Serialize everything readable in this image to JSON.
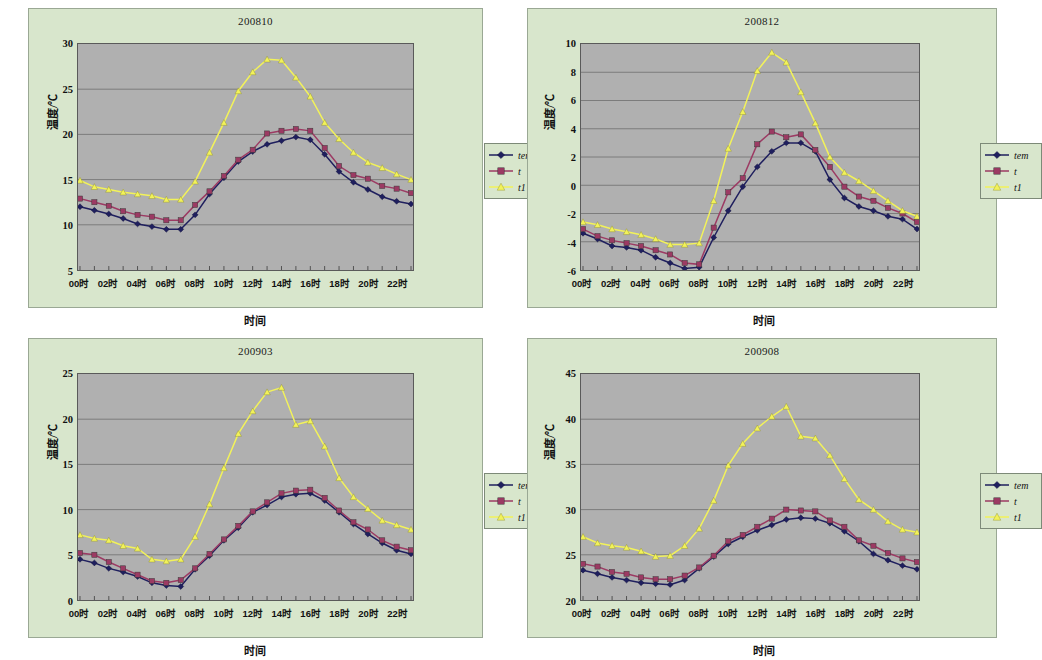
{
  "figure": {
    "background": "#ffffff",
    "chart_bg": "#d8e6cc",
    "plot_bg": "#b0b0b0",
    "series_colors": {
      "tem": "#1f1f5e",
      "t": "#9c3a63",
      "t1": "#f2f25a"
    }
  },
  "common": {
    "ylabel": "温度/℃",
    "xlabel": "时间",
    "xtick_labels": [
      "00时",
      "02时",
      "04时",
      "06时",
      "08时",
      "10时",
      "12时",
      "14时",
      "16时",
      "18时",
      "20时",
      "22时"
    ],
    "legend": [
      {
        "name": "tem",
        "label": "tem",
        "marker": "diamond",
        "color": "#1f1f5e"
      },
      {
        "name": "t",
        "label": "t",
        "marker": "square",
        "color": "#9c3a63"
      },
      {
        "name": "t1",
        "label": "t1",
        "marker": "triangle",
        "color": "#f2f25a"
      }
    ]
  },
  "chart_data": [
    {
      "id": "chart-200810",
      "type": "line",
      "title": "200810",
      "xlabel": "时间",
      "ylabel": "温度/℃",
      "ylim": [
        5,
        30
      ],
      "yticks": [
        5,
        10,
        15,
        20,
        25,
        30
      ],
      "grid": true,
      "legend_position": "right",
      "x": [
        "00时",
        "01时",
        "02时",
        "03时",
        "04时",
        "05时",
        "06时",
        "07时",
        "08时",
        "09时",
        "10时",
        "11时",
        "12时",
        "13时",
        "14时",
        "15时",
        "16时",
        "17时",
        "18时",
        "19时",
        "20时",
        "21时",
        "22时",
        "23时"
      ],
      "categories": [
        "00时",
        "02时",
        "04时",
        "06时",
        "08时",
        "10时",
        "12时",
        "14时",
        "16时",
        "18时",
        "20时",
        "22时"
      ],
      "series": [
        {
          "name": "tem",
          "values": [
            12.0,
            11.6,
            11.2,
            10.7,
            10.1,
            9.8,
            9.5,
            9.5,
            11.1,
            13.4,
            15.2,
            17.0,
            18.1,
            18.9,
            19.3,
            19.7,
            19.4,
            17.8,
            15.9,
            14.7,
            13.9,
            13.1,
            12.6,
            12.3
          ]
        },
        {
          "name": "t",
          "values": [
            12.9,
            12.5,
            12.1,
            11.5,
            11.1,
            10.9,
            10.5,
            10.5,
            12.2,
            13.7,
            15.4,
            17.2,
            18.3,
            20.1,
            20.4,
            20.6,
            20.4,
            18.5,
            16.5,
            15.5,
            15.1,
            14.3,
            14.0,
            13.5
          ]
        },
        {
          "name": "t1",
          "values": [
            14.9,
            14.2,
            13.9,
            13.6,
            13.4,
            13.2,
            12.8,
            12.8,
            14.8,
            18.0,
            21.3,
            24.8,
            26.9,
            28.3,
            28.2,
            26.3,
            24.2,
            21.3,
            19.5,
            18.0,
            16.9,
            16.3,
            15.6,
            15.0
          ]
        }
      ]
    },
    {
      "id": "chart-200812",
      "type": "line",
      "title": "200812",
      "xlabel": "时间",
      "ylabel": "温度/℃",
      "ylim": [
        -6,
        10
      ],
      "yticks": [
        -6,
        -4,
        -2,
        0,
        2,
        4,
        6,
        8,
        10
      ],
      "grid": true,
      "legend_position": "right",
      "x": [
        "00时",
        "01时",
        "02时",
        "03时",
        "04时",
        "05时",
        "06时",
        "07时",
        "08时",
        "09时",
        "10时",
        "11时",
        "12时",
        "13时",
        "14时",
        "15时",
        "16时",
        "17时",
        "18时",
        "19时",
        "20时",
        "21时",
        "22时",
        "23时"
      ],
      "categories": [
        "00时",
        "02时",
        "04时",
        "06时",
        "08时",
        "10时",
        "12时",
        "14时",
        "16时",
        "18时",
        "20时",
        "22时"
      ],
      "series": [
        {
          "name": "tem",
          "values": [
            -3.4,
            -3.8,
            -4.3,
            -4.4,
            -4.6,
            -5.1,
            -5.5,
            -5.9,
            -5.8,
            -3.7,
            -1.8,
            -0.1,
            1.3,
            2.4,
            3.0,
            3.0,
            2.4,
            0.4,
            -0.9,
            -1.5,
            -1.8,
            -2.2,
            -2.4,
            -3.1
          ]
        },
        {
          "name": "t",
          "values": [
            -3.1,
            -3.6,
            -3.9,
            -4.1,
            -4.3,
            -4.6,
            -4.9,
            -5.5,
            -5.6,
            -3.0,
            -0.5,
            0.5,
            2.9,
            3.8,
            3.4,
            3.6,
            2.5,
            1.3,
            -0.1,
            -0.8,
            -1.1,
            -1.6,
            -2.0,
            -2.6
          ]
        },
        {
          "name": "t1",
          "values": [
            -2.6,
            -2.8,
            -3.1,
            -3.3,
            -3.5,
            -3.8,
            -4.2,
            -4.2,
            -4.1,
            -1.1,
            2.6,
            5.2,
            8.1,
            9.4,
            8.7,
            6.6,
            4.4,
            2.0,
            0.9,
            0.3,
            -0.4,
            -1.1,
            -1.8,
            -2.2
          ]
        }
      ]
    },
    {
      "id": "chart-200903",
      "type": "line",
      "title": "200903",
      "xlabel": "时间",
      "ylabel": "温度/℃",
      "ylim": [
        0,
        25
      ],
      "yticks": [
        0,
        5,
        10,
        15,
        20,
        25
      ],
      "grid": true,
      "legend_position": "right",
      "x": [
        "00时",
        "01时",
        "02时",
        "03时",
        "04时",
        "05时",
        "06时",
        "07时",
        "08时",
        "09时",
        "10时",
        "11时",
        "12时",
        "13时",
        "14时",
        "15时",
        "16时",
        "17时",
        "18时",
        "19时",
        "20时",
        "21时",
        "22时",
        "23时"
      ],
      "categories": [
        "00时",
        "02时",
        "04时",
        "06时",
        "08时",
        "10时",
        "12时",
        "14时",
        "16时",
        "18时",
        "20时",
        "22时"
      ],
      "series": [
        {
          "name": "tem",
          "values": [
            4.5,
            4.1,
            3.5,
            3.1,
            2.6,
            1.9,
            1.6,
            1.5,
            3.4,
            4.9,
            6.6,
            8.0,
            9.7,
            10.5,
            11.4,
            11.7,
            11.8,
            11.0,
            9.7,
            8.4,
            7.3,
            6.3,
            5.5,
            5.1
          ]
        },
        {
          "name": "t",
          "values": [
            5.2,
            5.0,
            4.2,
            3.5,
            2.8,
            2.1,
            1.9,
            2.2,
            3.5,
            5.1,
            6.7,
            8.2,
            9.8,
            10.8,
            11.8,
            12.1,
            12.2,
            11.3,
            9.9,
            8.6,
            7.8,
            6.6,
            5.9,
            5.5
          ]
        },
        {
          "name": "t1",
          "values": [
            7.2,
            6.8,
            6.6,
            6.0,
            5.7,
            4.5,
            4.3,
            4.5,
            7.0,
            10.6,
            14.6,
            18.4,
            20.9,
            23.0,
            23.5,
            19.4,
            19.8,
            17.0,
            13.5,
            11.4,
            10.1,
            8.8,
            8.3,
            7.8
          ]
        }
      ]
    },
    {
      "id": "chart-200908",
      "type": "line",
      "title": "200908",
      "xlabel": "时间",
      "ylabel": "温度/℃",
      "ylim": [
        20,
        45
      ],
      "yticks": [
        20,
        25,
        30,
        35,
        40,
        45
      ],
      "grid": true,
      "legend_position": "right",
      "x": [
        "00时",
        "01时",
        "02时",
        "03时",
        "04时",
        "05时",
        "06时",
        "07时",
        "08时",
        "09时",
        "10时",
        "11时",
        "12时",
        "13时",
        "14时",
        "15时",
        "16时",
        "17时",
        "18时",
        "19时",
        "20时",
        "21时",
        "22时",
        "23时"
      ],
      "categories": [
        "00时",
        "02时",
        "04时",
        "06时",
        "08时",
        "10时",
        "12时",
        "14时",
        "16时",
        "18时",
        "20时",
        "22时"
      ],
      "series": [
        {
          "name": "tem",
          "values": [
            23.3,
            22.9,
            22.5,
            22.2,
            21.9,
            21.8,
            21.7,
            22.2,
            23.5,
            24.8,
            26.2,
            27.0,
            27.7,
            28.3,
            28.9,
            29.1,
            29.0,
            28.5,
            27.6,
            26.5,
            25.1,
            24.4,
            23.8,
            23.4
          ]
        },
        {
          "name": "t",
          "values": [
            24.0,
            23.7,
            23.1,
            22.9,
            22.5,
            22.3,
            22.3,
            22.7,
            23.6,
            24.9,
            26.5,
            27.2,
            28.1,
            29.0,
            30.0,
            29.9,
            29.8,
            28.8,
            28.1,
            26.6,
            26.0,
            25.2,
            24.6,
            24.2
          ]
        },
        {
          "name": "t1",
          "values": [
            27.0,
            26.3,
            26.0,
            25.8,
            25.4,
            24.8,
            24.9,
            26.0,
            27.9,
            31.0,
            34.9,
            37.3,
            39.0,
            40.3,
            41.4,
            38.1,
            37.9,
            36.0,
            33.4,
            31.1,
            30.0,
            28.7,
            27.8,
            27.5
          ]
        }
      ]
    }
  ]
}
